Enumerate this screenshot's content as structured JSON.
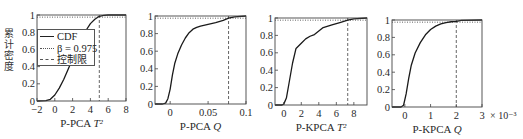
{
  "figure": {
    "ylabel": "累计密度",
    "legend": [
      {
        "label": "CDF",
        "style": "solid"
      },
      {
        "label": "β = 0.975",
        "style": "dotted"
      },
      {
        "label": "控制限",
        "style": "dashed"
      }
    ]
  },
  "chart_data": [
    {
      "type": "line",
      "title": "",
      "xlabel": "P-PCA T²",
      "ylabel": "累计密度",
      "xlim": [
        -2,
        8
      ],
      "ylim": [
        0,
        1
      ],
      "xticks": [
        -2,
        0,
        2,
        4,
        6,
        8
      ],
      "xtick_labels": [
        "−2",
        "0",
        "2",
        "4",
        "6",
        "8"
      ],
      "yticks": [
        0,
        0.2,
        0.4,
        0.6,
        0.8,
        1
      ],
      "ytick_labels": [
        "0",
        "0.2",
        "0.4",
        "0.6",
        "0.8",
        "1"
      ],
      "x_multiplier": "",
      "beta": 0.975,
      "control_limit": 5.0,
      "series": [
        {
          "name": "CDF",
          "x": [
            -2,
            -1,
            -0.5,
            0,
            0.5,
            1,
            1.5,
            2,
            2.5,
            3,
            3.5,
            4,
            4.5,
            5,
            5.5,
            6,
            7,
            8
          ],
          "y": [
            0,
            0.005,
            0.02,
            0.07,
            0.15,
            0.25,
            0.37,
            0.49,
            0.61,
            0.72,
            0.82,
            0.9,
            0.95,
            0.985,
            0.995,
            1,
            1,
            1
          ]
        }
      ],
      "legend_position": "upper left (overlaps plot)",
      "grid": false
    },
    {
      "type": "line",
      "title": "",
      "xlabel": "P-PCA Q",
      "ylabel": "",
      "xlim": [
        -0.02,
        0.1
      ],
      "ylim": [
        0,
        1
      ],
      "xticks": [
        0,
        0.05,
        0.1
      ],
      "xtick_labels": [
        "0",
        "0.05",
        "0.1"
      ],
      "yticks": [
        0,
        0.2,
        0.4,
        0.6,
        0.8,
        1
      ],
      "ytick_labels": [
        "0",
        "0.2",
        "0.4",
        "0.6",
        "0.8",
        "1"
      ],
      "x_multiplier": "",
      "beta": 0.975,
      "control_limit": 0.077,
      "series": [
        {
          "name": "CDF",
          "x": [
            -0.02,
            -0.01,
            -0.006,
            -0.003,
            0,
            0.003,
            0.006,
            0.01,
            0.015,
            0.02,
            0.025,
            0.03,
            0.035,
            0.04,
            0.05,
            0.06,
            0.07,
            0.077,
            0.085,
            0.1
          ],
          "y": [
            0,
            0,
            0.01,
            0.06,
            0.17,
            0.33,
            0.46,
            0.57,
            0.67,
            0.75,
            0.81,
            0.85,
            0.87,
            0.885,
            0.905,
            0.925,
            0.95,
            0.975,
            0.99,
            1
          ]
        }
      ],
      "grid": false
    },
    {
      "type": "line",
      "title": "",
      "xlabel": "P-KPCA T²",
      "ylabel": "",
      "xlim": [
        -1,
        9.5
      ],
      "ylim": [
        0,
        1
      ],
      "xticks": [
        0,
        2,
        4,
        6,
        8
      ],
      "xtick_labels": [
        "0",
        "2",
        "4",
        "6",
        "8"
      ],
      "yticks": [
        0,
        0.2,
        0.4,
        0.6,
        0.8,
        1
      ],
      "ytick_labels": [
        "0",
        "0.2",
        "0.4",
        "0.6",
        "0.8",
        "1"
      ],
      "x_multiplier": "",
      "beta": 0.975,
      "control_limit": 7.3,
      "series": [
        {
          "name": "CDF",
          "x": [
            -1,
            -0.2,
            0,
            0.3,
            0.6,
            1.0,
            1.4,
            2.0,
            2.5,
            3.0,
            3.5,
            4.0,
            4.5,
            5.5,
            6.5,
            7.3,
            8.0,
            9.5
          ],
          "y": [
            0,
            0,
            0.01,
            0.08,
            0.25,
            0.48,
            0.65,
            0.71,
            0.76,
            0.79,
            0.81,
            0.85,
            0.89,
            0.92,
            0.95,
            0.975,
            0.99,
            1
          ]
        }
      ],
      "grid": false
    },
    {
      "type": "line",
      "title": "",
      "xlabel": "P-KPCA Q",
      "ylabel": "",
      "xlim": [
        -0.5,
        3
      ],
      "ylim": [
        0,
        1
      ],
      "xticks": [
        0,
        1,
        2,
        3
      ],
      "xtick_labels": [
        "0",
        "1",
        "2",
        "3"
      ],
      "yticks": [
        0,
        0.2,
        0.4,
        0.6,
        0.8,
        1
      ],
      "ytick_labels": [
        "0",
        "0.2",
        "0.4",
        "0.6",
        "0.8",
        "1"
      ],
      "x_multiplier": "× 10⁻³",
      "beta": 0.975,
      "control_limit": 2.0,
      "series": [
        {
          "name": "CDF",
          "x": [
            -0.5,
            -0.15,
            -0.05,
            0.05,
            0.15,
            0.25,
            0.4,
            0.6,
            0.8,
            1.0,
            1.2,
            1.4,
            1.6,
            1.8,
            2.0,
            2.2,
            3.0
          ],
          "y": [
            0,
            0,
            0.02,
            0.15,
            0.33,
            0.48,
            0.62,
            0.74,
            0.83,
            0.89,
            0.93,
            0.955,
            0.97,
            0.98,
            0.985,
            0.995,
            1
          ]
        }
      ],
      "grid": false
    }
  ],
  "layout": {
    "panels": [
      {
        "left": 37,
        "top": 15,
        "right": 126,
        "bottom": 101,
        "show_yticklabels": true
      },
      {
        "left": 155,
        "top": 16,
        "right": 246,
        "bottom": 104,
        "show_yticklabels": true
      },
      {
        "left": 275,
        "top": 18,
        "right": 367,
        "bottom": 105,
        "show_yticklabels": true
      },
      {
        "left": 392,
        "top": 20,
        "right": 482,
        "bottom": 107,
        "show_yticklabels": true
      }
    ]
  }
}
